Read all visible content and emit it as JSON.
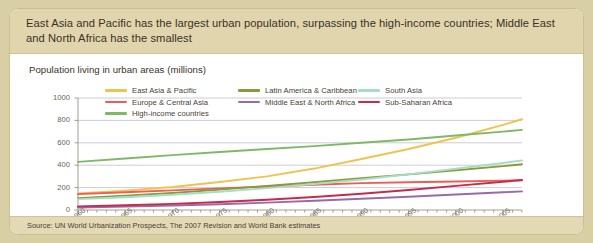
{
  "header": {
    "title": "East Asia and Pacific has the largest urban population, surpassing the high-income countries; Middle East and North Africa has the smallest"
  },
  "subtitle": "Population living in urban areas (millions)",
  "source": "Source: UN World Urbanization Prospects, The 2007 Revision and World Bank estimates",
  "colors": {
    "panel_background": "#fdfdfb",
    "outer_background": "#d9cfa4",
    "header_band": "#e0d5ad",
    "footer_band": "#e3d9b5",
    "border": "#cdbf8d",
    "gridline": "#b9b4c4",
    "axis": "#9a9486",
    "text": "#3a3226"
  },
  "chart_data": {
    "type": "line",
    "title": "Population living in urban areas (millions)",
    "xlabel": "",
    "ylabel": "",
    "ylim": [
      0,
      1000
    ],
    "xlim": [
      1960,
      2007
    ],
    "yticks": [
      0,
      200,
      400,
      600,
      800,
      1000
    ],
    "xticks": [
      1960,
      1965,
      1970,
      1975,
      1980,
      1985,
      1990,
      1995,
      2000,
      2005
    ],
    "xtick_labels": [
      "1960",
      "1965",
      "1970",
      "1975",
      "1980",
      "1985",
      "1990",
      "1995",
      "2000",
      "2005"
    ],
    "minor_xtick_interval": 1,
    "grid": "horizontal",
    "legend_position": "top-inside",
    "x": [
      1960,
      1965,
      1970,
      1975,
      1980,
      1985,
      1990,
      1995,
      2000,
      2005,
      2007
    ],
    "series": [
      {
        "name": "East Asia & Pacific",
        "color": "#f0c350",
        "values": [
          148,
          173,
          205,
          250,
          300,
          370,
          455,
          545,
          645,
          760,
          810
        ]
      },
      {
        "name": "Europe & Central Asia",
        "color": "#ef5d52",
        "values": [
          142,
          158,
          175,
          193,
          210,
          225,
          240,
          248,
          255,
          262,
          265
        ]
      },
      {
        "name": "High-income countries",
        "color": "#7cbb63",
        "values": [
          430,
          460,
          490,
          518,
          545,
          570,
          600,
          630,
          665,
          700,
          715
        ]
      },
      {
        "name": "Latin America & Caribbean",
        "color": "#8a9a3a",
        "values": [
          106,
          128,
          152,
          182,
          215,
          248,
          283,
          318,
          355,
          392,
          408
        ]
      },
      {
        "name": "Middle East & North Africa",
        "color": "#9a6aa8",
        "values": [
          22,
          30,
          40,
          52,
          66,
          82,
          100,
          118,
          138,
          158,
          166
        ]
      },
      {
        "name": "South Asia",
        "color": "#a6ddc4",
        "values": [
          97,
          114,
          136,
          163,
          195,
          232,
          272,
          318,
          368,
          420,
          442
        ]
      },
      {
        "name": "Sub-Saharan Africa",
        "color": "#c9294a",
        "values": [
          32,
          42,
          55,
          72,
          92,
          116,
          145,
          178,
          215,
          252,
          268
        ]
      }
    ],
    "legend_layout": [
      [
        "East Asia & Pacific",
        "Latin America & Caribbean",
        "South Asia"
      ],
      [
        "Europe & Central Asia",
        "Middle East & North Africa",
        "Sub-Saharan Africa"
      ],
      [
        "High-income countries"
      ]
    ]
  }
}
